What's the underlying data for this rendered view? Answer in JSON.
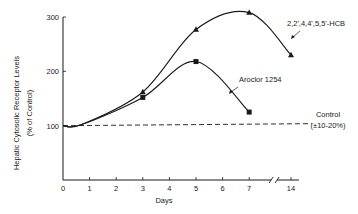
{
  "chart_data": {
    "type": "line",
    "title": "",
    "xlabel": "Days",
    "ylabel": "Hepatic Cytosolic Receptor Levels",
    "ylabel_sub": "(% of Control)",
    "x_ticks": [
      "0",
      "1",
      "2",
      "3",
      "4",
      "5",
      "6",
      "7",
      "14"
    ],
    "x_tick_values": [
      0,
      1,
      2,
      3,
      4,
      5,
      6,
      7,
      14
    ],
    "x_axis_break": "between 7 and 14",
    "y_ticks": [
      "100",
      "200",
      "300"
    ],
    "y_tick_values": [
      100,
      200,
      300
    ],
    "ylim": [
      0,
      300
    ],
    "grid": false,
    "series": [
      {
        "name": "2,2',4,4',5,5'-HCB",
        "marker": "triangle",
        "points": [
          {
            "x": 0,
            "y": 100
          },
          {
            "x": 3,
            "y": 162
          },
          {
            "x": 5,
            "y": 277
          },
          {
            "x": 7,
            "y": 308
          },
          {
            "x": 14,
            "y": 230
          }
        ]
      },
      {
        "name": "Aroclor 1254",
        "marker": "square",
        "points": [
          {
            "x": 0,
            "y": 100
          },
          {
            "x": 3,
            "y": 152
          },
          {
            "x": 5,
            "y": 218
          },
          {
            "x": 7,
            "y": 125
          }
        ]
      }
    ],
    "reference_line": {
      "name": "Control",
      "value": 100,
      "style": "dashed",
      "label": "Control",
      "label_sub": "(±10-20%)"
    },
    "annotations": [
      {
        "text": "2,2',4,4',5,5'-HCB",
        "target_series": "2,2',4,4',5,5'-HCB"
      },
      {
        "text": "Aroclor 1254",
        "target_series": "Aroclor 1254"
      }
    ]
  }
}
